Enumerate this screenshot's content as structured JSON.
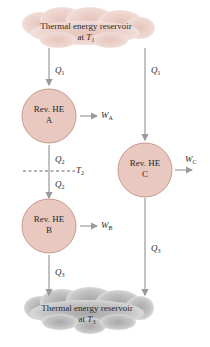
{
  "colors": {
    "hot_cloud": "#ecd3cc",
    "hot_cloud_edge": "#f6e8e4",
    "cold_cloud": "#b9b9b9",
    "cold_cloud_edge": "#e4e4e4",
    "engine_fill": "#e8c8bf",
    "engine_stroke": "#c89a8e",
    "arrow": "#9a9a9a",
    "text": "#2a2a2a"
  },
  "reservoirs": {
    "hot": {
      "line1": "Thermal energy reservoir",
      "line2_prefix": "at ",
      "temp_symbol": "T",
      "temp_sub": "1"
    },
    "cold": {
      "line1": "Thermal energy reservoir",
      "line2_prefix": "at ",
      "temp_symbol": "T",
      "temp_sub": "3"
    }
  },
  "engines": [
    {
      "id": "A",
      "line1": "Rev. HE",
      "line2": "A",
      "work_symbol": "W",
      "work_sub": "A"
    },
    {
      "id": "B",
      "line1": "Rev. HE",
      "line2": "B",
      "work_symbol": "W",
      "work_sub": "B"
    },
    {
      "id": "C",
      "line1": "Rev. HE",
      "line2": "C",
      "work_symbol": "W",
      "work_sub": "C"
    }
  ],
  "heat_flows": {
    "hot_to_A": {
      "symbol": "Q",
      "sub": "1"
    },
    "hot_to_C": {
      "symbol": "Q",
      "sub": "1"
    },
    "A_out": {
      "symbol": "Q",
      "sub": "2"
    },
    "B_in": {
      "symbol": "Q",
      "sub": "2"
    },
    "B_to_cold": {
      "symbol": "Q",
      "sub": "3"
    },
    "C_to_cold": {
      "symbol": "Q",
      "sub": "3"
    }
  },
  "intermediate": {
    "symbol": "T",
    "sub": "2"
  }
}
